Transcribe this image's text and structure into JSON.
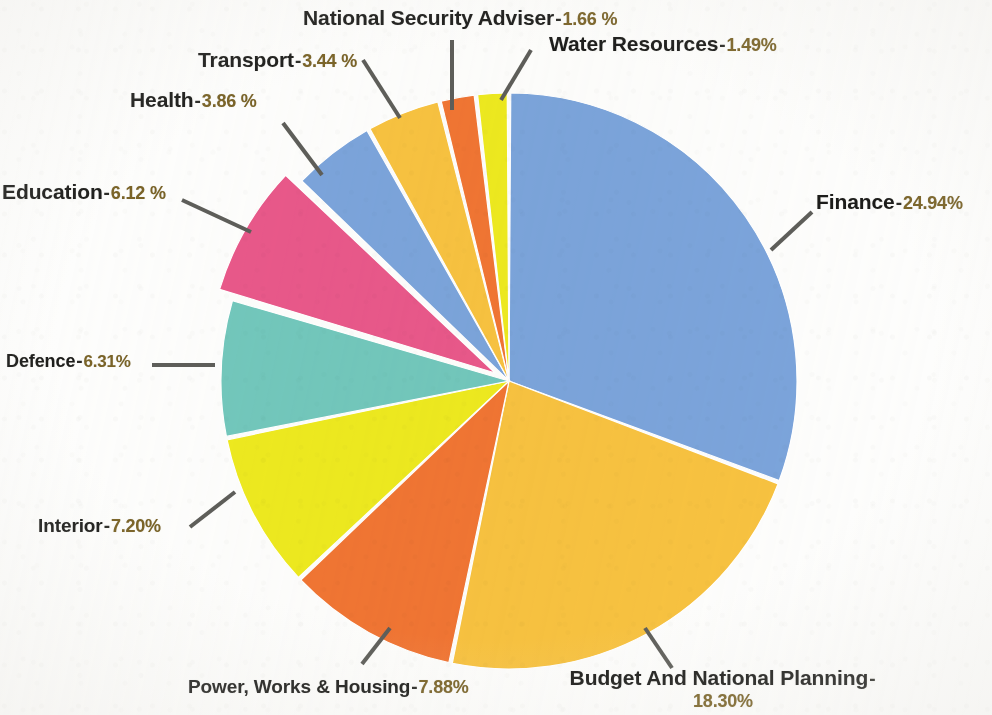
{
  "chart_data": {
    "type": "pie",
    "title": "",
    "subtitle": "",
    "xlabel": "",
    "ylabel": "",
    "legend_position": "none",
    "grid": false,
    "unit": "%",
    "start_angle_deg": 0,
    "direction": "clockwise",
    "categories": [
      "Finance",
      "Budget And National Planning",
      "Power, Works & Housing",
      "Interior",
      "Defence",
      "Education",
      "Health",
      "Transport",
      "National Security Adviser",
      "Water Resources"
    ],
    "values": [
      24.94,
      18.3,
      7.88,
      7.2,
      6.31,
      6.12,
      3.86,
      3.44,
      1.66,
      1.49
    ],
    "colors": [
      "#7BA4DB",
      "#F7C240",
      "#F07533",
      "#EDE91F",
      "#72C7BC",
      "#E8588A",
      "#7BA4DB",
      "#F7C240",
      "#F07533",
      "#EDE91F"
    ],
    "exploded": [
      false,
      false,
      false,
      false,
      false,
      true,
      false,
      false,
      false,
      false
    ],
    "slices": [
      {
        "label": "Finance",
        "value": 24.94,
        "value_text": "24.94%",
        "color": "#7BA4DB",
        "exploded": false
      },
      {
        "label": "Budget And National Planning",
        "value": 18.3,
        "value_text": "18.30%",
        "color": "#F7C240",
        "exploded": false
      },
      {
        "label": "Power, Works & Housing",
        "value": 7.88,
        "value_text": "7.88%",
        "color": "#F07533",
        "exploded": false
      },
      {
        "label": "Interior",
        "value": 7.2,
        "value_text": "7.20%",
        "color": "#EDE91F",
        "exploded": false
      },
      {
        "label": "Defence",
        "value": 6.31,
        "value_text": "6.31%",
        "color": "#72C7BC",
        "exploded": false
      },
      {
        "label": "Education",
        "value": 6.12,
        "value_text": "6.12 %",
        "color": "#E8588A",
        "exploded": true
      },
      {
        "label": "Health",
        "value": 3.86,
        "value_text": "3.86 %",
        "color": "#7BA4DB",
        "exploded": false
      },
      {
        "label": "Transport",
        "value": 3.44,
        "value_text": "3.44 %",
        "color": "#F7C240",
        "exploded": false
      },
      {
        "label": "National Security Adviser",
        "value": 1.66,
        "value_text": "1.66 %",
        "color": "#F07533",
        "exploded": false
      },
      {
        "label": "Water Resources",
        "value": 1.49,
        "value_text": "1.49%",
        "color": "#EDE91F",
        "exploded": false
      }
    ]
  },
  "labels": {
    "finance": {
      "name": "Finance",
      "sep": "-",
      "pct": "24.94%"
    },
    "budget_national_planning": {
      "name": "Budget And National Planning",
      "sep": "-",
      "pct": "18.30%"
    },
    "power_works_housing": {
      "name": "Power, Works & Housing",
      "sep": "-",
      "pct": "7.88%"
    },
    "interior": {
      "name": "Interior",
      "sep": "-",
      "pct": "7.20%"
    },
    "defence": {
      "name": "Defence",
      "sep": "-",
      "pct": "6.31%"
    },
    "education": {
      "name": "Education",
      "sep": "-",
      "pct": "6.12 %"
    },
    "health": {
      "name": "Health",
      "sep": "-",
      "pct": "3.86 %"
    },
    "transport": {
      "name": "Transport",
      "sep": "-",
      "pct": "3.44 %"
    },
    "national_security_adviser": {
      "name": "National Security Adviser",
      "sep": "-",
      "pct": "1.66 %"
    },
    "water_resources": {
      "name": "Water  Resources",
      "sep": "-",
      "pct": "1.49%"
    }
  },
  "geometry": {
    "center_x": 509,
    "center_y": 381,
    "radius": 288,
    "explode_offset": 16,
    "gap_deg": 0.7,
    "leader_color": "#5e5e5a",
    "leader_width": 4
  },
  "background": "#fdfdfc"
}
